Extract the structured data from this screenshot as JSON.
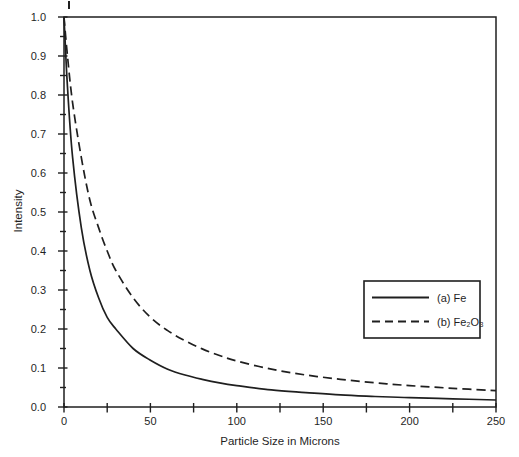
{
  "figure": {
    "background": "#ffffff",
    "ink_color": "#1f1f1f"
  },
  "chart_data": {
    "type": "line",
    "title": "",
    "xlabel": "Particle Size in Microns",
    "ylabel": "Intensity",
    "xlim": [
      0,
      250
    ],
    "ylim": [
      0.0,
      1.0
    ],
    "grid": false,
    "frame": true,
    "xticks": [
      0,
      50,
      100,
      150,
      200,
      250
    ],
    "xtick_labels": [
      "0",
      "50",
      "100",
      "150",
      "200",
      "250"
    ],
    "xminor_step": 25,
    "yticks": [
      0.0,
      0.1,
      0.2,
      0.3,
      0.4,
      0.5,
      0.6,
      0.7,
      0.8,
      0.9,
      1.0
    ],
    "ytick_labels": [
      "0.0",
      "0.1",
      "0.2",
      "0.3",
      "0.4",
      "0.5",
      "0.6",
      "0.7",
      "0.8",
      "0.9",
      "1.0"
    ],
    "yminor_step": 0.05,
    "legend_position": "middle-right",
    "x": [
      0,
      2,
      5,
      10,
      15,
      20,
      25,
      30,
      40,
      50,
      60,
      70,
      80,
      90,
      100,
      120,
      140,
      160,
      180,
      200,
      225,
      250
    ],
    "series": [
      {
        "name": "(a) Fe",
        "line_style": "solid",
        "values": [
          1.0,
          0.82,
          0.64,
          0.46,
          0.35,
          0.28,
          0.23,
          0.2,
          0.15,
          0.12,
          0.097,
          0.082,
          0.071,
          0.062,
          0.055,
          0.044,
          0.037,
          0.031,
          0.027,
          0.024,
          0.021,
          0.018
        ]
      },
      {
        "name": "(b) Fe₂O₃",
        "line_style": "dashed",
        "values": [
          1.0,
          0.9,
          0.78,
          0.64,
          0.53,
          0.46,
          0.4,
          0.35,
          0.28,
          0.23,
          0.196,
          0.17,
          0.149,
          0.132,
          0.118,
          0.097,
          0.082,
          0.071,
          0.062,
          0.055,
          0.048,
          0.042
        ]
      }
    ]
  }
}
